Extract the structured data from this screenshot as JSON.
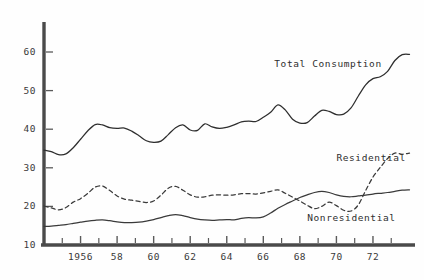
{
  "chart_data": {
    "type": "line",
    "title": "",
    "subtitle": "",
    "xlabel": "",
    "ylabel": "",
    "xlim": [
      1954.0,
      1974.3
    ],
    "ylim": [
      10,
      64
    ],
    "grid": false,
    "legend_position": "inline-annotations",
    "ytick_labels": [
      "10",
      "20",
      "30",
      "40",
      "50",
      "60"
    ],
    "ytick_values": [
      10,
      20,
      30,
      40,
      50,
      60
    ],
    "xtick_labels": [
      "1956",
      "58",
      "60",
      "62",
      "64",
      "66",
      "68",
      "70",
      "72"
    ],
    "xtick_values": [
      1956,
      1958,
      1960,
      1962,
      1964,
      1966,
      1968,
      1970,
      1972
    ],
    "xtick_minor_values": [
      1955,
      1957,
      1959,
      1961,
      1963,
      1965,
      1967,
      1969,
      1971,
      1973
    ],
    "annotations": [
      {
        "text": "Total Consumption",
        "x": 1966.6,
        "y": 57.0
      },
      {
        "text": "Residential",
        "x": 1970.0,
        "y": 32.6
      },
      {
        "text": "Nonresidential",
        "x": 1968.4,
        "y": 17.0
      }
    ],
    "series": [
      {
        "name": "Total Consumption",
        "style": "solid",
        "color": "#2e2e2e",
        "x": [
          1954.0,
          1954.4,
          1954.8,
          1955.2,
          1955.6,
          1956.0,
          1956.4,
          1956.8,
          1957.2,
          1957.6,
          1958.0,
          1958.4,
          1958.8,
          1959.2,
          1959.6,
          1960.0,
          1960.4,
          1960.8,
          1961.2,
          1961.6,
          1962.0,
          1962.4,
          1962.8,
          1963.2,
          1963.6,
          1964.0,
          1964.4,
          1964.8,
          1965.2,
          1965.6,
          1966.0,
          1966.4,
          1966.8,
          1967.2,
          1967.6,
          1968.0,
          1968.4,
          1968.8,
          1969.2,
          1969.6,
          1970.0,
          1970.4,
          1970.8,
          1971.2,
          1971.6,
          1972.0,
          1972.4,
          1972.8,
          1973.2,
          1973.6,
          1974.0
        ],
        "y": [
          34.6,
          34.2,
          33.4,
          33.6,
          35.2,
          37.4,
          39.6,
          41.2,
          41.1,
          40.4,
          40.2,
          40.3,
          39.5,
          38.3,
          37.0,
          36.6,
          36.9,
          38.6,
          40.4,
          41.1,
          39.8,
          39.7,
          41.4,
          40.6,
          40.2,
          40.5,
          41.1,
          41.9,
          42.1,
          42.0,
          43.1,
          44.4,
          46.3,
          45.0,
          42.6,
          41.6,
          41.7,
          43.4,
          44.9,
          44.6,
          43.8,
          43.9,
          45.5,
          48.6,
          51.5,
          53.1,
          53.6,
          55.0,
          57.8,
          59.3,
          59.4
        ]
      },
      {
        "name": "Residential",
        "style": "dashed",
        "color": "#3a3a3a",
        "x": [
          1954.0,
          1954.4,
          1954.8,
          1955.2,
          1955.6,
          1956.0,
          1956.4,
          1956.8,
          1957.2,
          1957.6,
          1958.0,
          1958.4,
          1958.8,
          1959.2,
          1959.6,
          1960.0,
          1960.4,
          1960.8,
          1961.2,
          1961.6,
          1962.0,
          1962.4,
          1962.8,
          1963.2,
          1963.6,
          1964.0,
          1964.4,
          1964.8,
          1965.2,
          1965.6,
          1966.0,
          1966.4,
          1966.8,
          1967.2,
          1967.6,
          1968.0,
          1968.4,
          1968.8,
          1969.2,
          1969.6,
          1970.0,
          1970.4,
          1970.8,
          1971.2,
          1971.6,
          1972.0,
          1972.4,
          1972.8,
          1973.2,
          1973.6,
          1974.0
        ],
        "y": [
          20.1,
          19.6,
          19.1,
          19.7,
          21.1,
          22.0,
          23.4,
          25.0,
          25.3,
          24.1,
          22.7,
          21.9,
          21.6,
          21.3,
          21.0,
          21.4,
          22.9,
          24.7,
          25.2,
          24.2,
          23.0,
          22.4,
          22.5,
          22.9,
          23.0,
          22.9,
          23.0,
          23.3,
          23.3,
          23.2,
          23.5,
          23.9,
          24.3,
          23.4,
          22.4,
          21.4,
          20.3,
          19.4,
          20.0,
          21.1,
          20.2,
          19.0,
          18.8,
          20.4,
          24.1,
          27.6,
          30.1,
          32.4,
          33.8,
          33.5,
          33.8
        ]
      },
      {
        "name": "Nonresidential",
        "style": "solid",
        "color": "#3a3a3a",
        "x": [
          1954.0,
          1954.4,
          1954.8,
          1955.2,
          1955.6,
          1956.0,
          1956.4,
          1956.8,
          1957.2,
          1957.6,
          1958.0,
          1958.4,
          1958.8,
          1959.2,
          1959.6,
          1960.0,
          1960.4,
          1960.8,
          1961.2,
          1961.6,
          1962.0,
          1962.4,
          1962.8,
          1963.2,
          1963.6,
          1964.0,
          1964.4,
          1964.8,
          1965.2,
          1965.6,
          1966.0,
          1966.4,
          1966.8,
          1967.2,
          1967.6,
          1968.0,
          1968.4,
          1968.8,
          1969.2,
          1969.6,
          1970.0,
          1970.4,
          1970.8,
          1971.2,
          1971.6,
          1972.0,
          1972.4,
          1972.8,
          1973.2,
          1973.6,
          1974.0
        ],
        "y": [
          14.8,
          14.9,
          15.1,
          15.3,
          15.6,
          15.9,
          16.2,
          16.4,
          16.5,
          16.3,
          16.0,
          15.8,
          15.8,
          15.9,
          16.2,
          16.6,
          17.1,
          17.6,
          17.9,
          17.6,
          17.1,
          16.7,
          16.5,
          16.4,
          16.5,
          16.6,
          16.5,
          16.9,
          17.1,
          17.0,
          17.3,
          18.3,
          19.5,
          20.5,
          21.4,
          22.3,
          23.0,
          23.6,
          23.9,
          23.6,
          23.0,
          22.6,
          22.5,
          22.7,
          22.9,
          23.2,
          23.4,
          23.6,
          23.9,
          24.2,
          24.3
        ]
      }
    ]
  }
}
